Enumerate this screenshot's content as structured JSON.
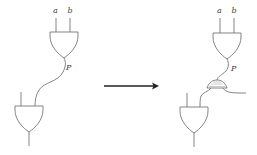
{
  "diagram": {
    "type": "circuit-transformation",
    "left_circuit": {
      "top_gate": {
        "kind": "AND",
        "inputs": [
          "a",
          "b"
        ],
        "output_label": "P"
      },
      "bottom_gate": {
        "kind": "AND",
        "inputs": [
          "",
          "P"
        ]
      }
    },
    "transformation_arrow": {
      "direction": "right"
    },
    "right_circuit": {
      "top_gate": {
        "kind": "AND",
        "inputs": [
          "a",
          "b"
        ],
        "output_label": "P"
      },
      "fanout_gadget": {
        "kind": "splitter",
        "outputs": 2
      },
      "bottom_gate": {
        "kind": "AND",
        "inputs": [
          "",
          "P"
        ]
      }
    },
    "labels": {
      "left_a": "a",
      "left_b": "b",
      "left_p": "P",
      "right_a": "a",
      "right_b": "b",
      "right_p": "P"
    },
    "colors": {
      "wire": "#777777",
      "arrow": "#222222",
      "background": "#ffffff"
    }
  }
}
